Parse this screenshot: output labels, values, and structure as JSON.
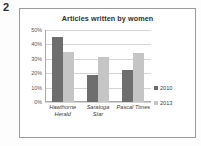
{
  "item_number": "2",
  "chart_data": {
    "type": "bar",
    "title": "Articles written by women",
    "xlabel": "",
    "ylabel": "",
    "categories": [
      "Hawthorne Herald",
      "Saratoga Star",
      "Pascal Times"
    ],
    "category_lines": [
      [
        "Hawthorne",
        "Herald"
      ],
      [
        "Saratoga",
        "Star"
      ],
      [
        "Pascal Times",
        ""
      ]
    ],
    "series": [
      {
        "name": "2010",
        "color": "#6e6e6e",
        "values": [
          45,
          19,
          22
        ]
      },
      {
        "name": "2013",
        "color": "#c5c5c5",
        "values": [
          35,
          31,
          34
        ]
      }
    ],
    "ylim": [
      0,
      50
    ],
    "ytick_labels": [
      "50%",
      "40%",
      "30%",
      "20%",
      "10%",
      "0%"
    ],
    "ytick_values": [
      50,
      40,
      30,
      20,
      10,
      0
    ],
    "grid": true,
    "legend_position": "right"
  }
}
